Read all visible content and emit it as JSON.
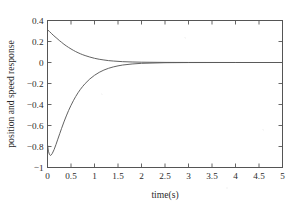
{
  "chart_data": {
    "type": "line",
    "title": "",
    "xlabel": "time(s)",
    "ylabel": "position and speed response",
    "xlim": [
      0,
      5
    ],
    "ylim": [
      -1,
      0.4
    ],
    "grid": false,
    "legend": "none",
    "xticks": [
      0,
      0.5,
      1,
      1.5,
      2,
      2.5,
      3,
      3.5,
      4,
      4.5,
      5
    ],
    "xticklabels": [
      "0",
      "0.5",
      "1",
      "1.5",
      "2",
      "2.5",
      "3",
      "3.5",
      "4",
      "4.5",
      "5"
    ],
    "yticks": [
      0.4,
      0.2,
      0,
      -0.2,
      -0.4,
      -0.6,
      -0.8,
      -1
    ],
    "yticklabels": [
      "0.4",
      "0.2",
      "0",
      "−0.2",
      "−0.4",
      "−0.6",
      "−0.8",
      "−1"
    ],
    "line_color": "#5a5a5a",
    "series": [
      {
        "name": "position response",
        "x": [
          0,
          0.04,
          0.08,
          0.12,
          0.16,
          0.2,
          0.25,
          0.3,
          0.35,
          0.4,
          0.45,
          0.5,
          0.55,
          0.6,
          0.65,
          0.7,
          0.75,
          0.8,
          0.9,
          1.0,
          1.1,
          1.2,
          1.3,
          1.4,
          1.5,
          1.6,
          1.8,
          2.0,
          2.5,
          3.0,
          3.5,
          4.0,
          4.5,
          5.0
        ],
        "y": [
          0.312,
          0.296,
          0.278,
          0.261,
          0.245,
          0.23,
          0.21,
          0.192,
          0.174,
          0.158,
          0.143,
          0.129,
          0.116,
          0.104,
          0.093,
          0.083,
          0.074,
          0.066,
          0.052,
          0.04,
          0.031,
          0.024,
          0.018,
          0.014,
          0.011,
          0.008,
          0.005,
          0.003,
          0.001,
          0.0004,
          0.0002,
          0.0001,
          0.0,
          0.0
        ]
      },
      {
        "name": "speed response",
        "x": [
          0,
          0.02,
          0.04,
          0.06,
          0.08,
          0.1,
          0.14,
          0.18,
          0.22,
          0.26,
          0.3,
          0.35,
          0.4,
          0.45,
          0.5,
          0.55,
          0.6,
          0.65,
          0.7,
          0.75,
          0.8,
          0.9,
          1.0,
          1.1,
          1.2,
          1.3,
          1.4,
          1.5,
          1.6,
          1.8,
          2.0,
          2.5,
          3.0,
          3.5,
          4.0,
          4.5,
          5.0
        ],
        "y": [
          -0.78,
          -0.845,
          -0.875,
          -0.885,
          -0.88,
          -0.868,
          -0.83,
          -0.782,
          -0.73,
          -0.678,
          -0.627,
          -0.566,
          -0.509,
          -0.456,
          -0.408,
          -0.364,
          -0.324,
          -0.288,
          -0.256,
          -0.227,
          -0.201,
          -0.157,
          -0.122,
          -0.094,
          -0.072,
          -0.055,
          -0.042,
          -0.032,
          -0.024,
          -0.014,
          -0.008,
          -0.002,
          -0.0006,
          -0.0002,
          -0.0001,
          0.0,
          0.0
        ]
      }
    ]
  }
}
